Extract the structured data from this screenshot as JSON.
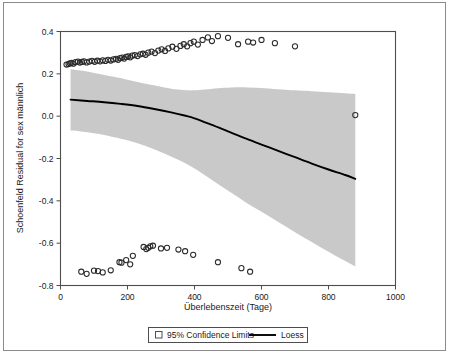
{
  "chart_data": {
    "type": "scatter",
    "title": "",
    "xlabel": "Überlebenszeit (Tage)",
    "ylabel": "Schoenfeld Residual for sex männlich",
    "xlim": [
      0,
      1000
    ],
    "ylim": [
      -0.8,
      0.4
    ],
    "xticks": [
      "0",
      "200",
      "400",
      "600",
      "800",
      "1000"
    ],
    "xtick_values": [
      0,
      200,
      400,
      600,
      800,
      1000
    ],
    "yticks": [
      "0.4",
      "0.2",
      "0.0",
      "-0.2",
      "-0.4",
      "-0.6",
      "-0.8"
    ],
    "ytick_values": [
      0.4,
      0.2,
      0.0,
      -0.2,
      -0.4,
      -0.6,
      -0.8
    ],
    "grid": false,
    "legend_position": "bottom-center",
    "legend": [
      {
        "name": "95% Confidence Limits",
        "marker": "filled-square-outline",
        "color": "#c9c9c9"
      },
      {
        "name": "Loess",
        "marker": "line",
        "color": "#000000"
      }
    ],
    "series": [
      {
        "name": "Schoenfeld residuals",
        "type": "scatter",
        "marker": "open-circle",
        "color": "#2b2b2b",
        "points": [
          [
            18,
            0.244
          ],
          [
            24,
            0.246
          ],
          [
            28,
            0.25
          ],
          [
            33,
            0.252
          ],
          [
            38,
            0.248
          ],
          [
            45,
            0.255
          ],
          [
            52,
            0.258
          ],
          [
            58,
            0.253
          ],
          [
            64,
            0.256
          ],
          [
            70,
            0.259
          ],
          [
            78,
            0.254
          ],
          [
            86,
            0.258
          ],
          [
            94,
            0.261
          ],
          [
            102,
            0.257
          ],
          [
            110,
            0.262
          ],
          [
            118,
            0.259
          ],
          [
            126,
            0.264
          ],
          [
            134,
            0.261
          ],
          [
            142,
            0.266
          ],
          [
            150,
            0.263
          ],
          [
            158,
            0.268
          ],
          [
            166,
            0.271
          ],
          [
            172,
            0.266
          ],
          [
            178,
            0.274
          ],
          [
            184,
            0.277
          ],
          [
            190,
            0.272
          ],
          [
            196,
            0.28
          ],
          [
            202,
            0.283
          ],
          [
            208,
            0.278
          ],
          [
            214,
            0.286
          ],
          [
            222,
            0.289
          ],
          [
            230,
            0.284
          ],
          [
            238,
            0.292
          ],
          [
            246,
            0.295
          ],
          [
            254,
            0.29
          ],
          [
            262,
            0.3
          ],
          [
            272,
            0.305
          ],
          [
            282,
            0.298
          ],
          [
            292,
            0.31
          ],
          [
            302,
            0.316
          ],
          [
            312,
            0.308
          ],
          [
            322,
            0.32
          ],
          [
            334,
            0.328
          ],
          [
            346,
            0.318
          ],
          [
            358,
            0.332
          ],
          [
            368,
            0.34
          ],
          [
            378,
            0.33
          ],
          [
            388,
            0.345
          ],
          [
            398,
            0.352
          ],
          [
            410,
            0.338
          ],
          [
            424,
            0.36
          ],
          [
            440,
            0.372
          ],
          [
            452,
            0.355
          ],
          [
            470,
            0.378
          ],
          [
            500,
            0.37
          ],
          [
            530,
            0.34
          ],
          [
            560,
            0.352
          ],
          [
            575,
            0.348
          ],
          [
            600,
            0.36
          ],
          [
            640,
            0.345
          ],
          [
            700,
            0.33
          ],
          [
            880,
            0.005
          ],
          [
            62,
            -0.735
          ],
          [
            78,
            -0.745
          ],
          [
            100,
            -0.73
          ],
          [
            112,
            -0.732
          ],
          [
            126,
            -0.738
          ],
          [
            150,
            -0.728
          ],
          [
            176,
            -0.69
          ],
          [
            182,
            -0.692
          ],
          [
            196,
            -0.68
          ],
          [
            208,
            -0.7
          ],
          [
            216,
            -0.66
          ],
          [
            248,
            -0.618
          ],
          [
            256,
            -0.628
          ],
          [
            262,
            -0.622
          ],
          [
            268,
            -0.615
          ],
          [
            276,
            -0.612
          ],
          [
            300,
            -0.625
          ],
          [
            318,
            -0.622
          ],
          [
            352,
            -0.63
          ],
          [
            372,
            -0.638
          ],
          [
            396,
            -0.655
          ],
          [
            470,
            -0.69
          ],
          [
            540,
            -0.718
          ],
          [
            566,
            -0.735
          ]
        ]
      },
      {
        "name": "Loess",
        "type": "line",
        "color": "#000000",
        "points": [
          [
            30,
            0.078
          ],
          [
            80,
            0.072
          ],
          [
            130,
            0.066
          ],
          [
            180,
            0.058
          ],
          [
            230,
            0.048
          ],
          [
            280,
            0.034
          ],
          [
            330,
            0.018
          ],
          [
            370,
            0.003
          ],
          [
            400,
            -0.01
          ],
          [
            450,
            -0.04
          ],
          [
            500,
            -0.072
          ],
          [
            550,
            -0.104
          ],
          [
            600,
            -0.134
          ],
          [
            650,
            -0.164
          ],
          [
            700,
            -0.194
          ],
          [
            750,
            -0.224
          ],
          [
            800,
            -0.252
          ],
          [
            850,
            -0.278
          ],
          [
            880,
            -0.296
          ]
        ]
      },
      {
        "name": "95% Confidence Limits",
        "type": "band",
        "color": "#c9c9c9",
        "upper": [
          [
            30,
            0.222
          ],
          [
            60,
            0.216
          ],
          [
            90,
            0.208
          ],
          [
            120,
            0.198
          ],
          [
            150,
            0.188
          ],
          [
            190,
            0.176
          ],
          [
            230,
            0.162
          ],
          [
            270,
            0.148
          ],
          [
            310,
            0.136
          ],
          [
            350,
            0.126
          ],
          [
            380,
            0.122
          ],
          [
            400,
            0.122
          ],
          [
            430,
            0.126
          ],
          [
            470,
            0.132
          ],
          [
            510,
            0.136
          ],
          [
            560,
            0.136
          ],
          [
            610,
            0.132
          ],
          [
            660,
            0.126
          ],
          [
            700,
            0.122
          ],
          [
            750,
            0.118
          ],
          [
            800,
            0.113
          ],
          [
            850,
            0.108
          ],
          [
            880,
            0.105
          ]
        ],
        "lower": [
          [
            30,
            -0.068
          ],
          [
            60,
            -0.072
          ],
          [
            90,
            -0.078
          ],
          [
            120,
            -0.086
          ],
          [
            150,
            -0.096
          ],
          [
            190,
            -0.11
          ],
          [
            230,
            -0.128
          ],
          [
            270,
            -0.15
          ],
          [
            310,
            -0.176
          ],
          [
            350,
            -0.205
          ],
          [
            390,
            -0.238
          ],
          [
            430,
            -0.278
          ],
          [
            470,
            -0.32
          ],
          [
            510,
            -0.362
          ],
          [
            550,
            -0.404
          ],
          [
            600,
            -0.452
          ],
          [
            650,
            -0.5
          ],
          [
            700,
            -0.548
          ],
          [
            750,
            -0.594
          ],
          [
            800,
            -0.64
          ],
          [
            850,
            -0.684
          ],
          [
            880,
            -0.71
          ]
        ]
      }
    ]
  },
  "axes": {
    "x_title": "Überlebenszeit (Tage)",
    "y_title": "Schoenfeld Residual for sex männlich"
  },
  "legend": {
    "ci_label": "95% Confidence Limits",
    "loess_label": "Loess"
  },
  "colors": {
    "band": "#c9c9c9",
    "line": "#000000",
    "marker": "#2b2b2b",
    "axis": "#4d4d4d",
    "frame": "#8b8b8b",
    "background": "#ffffff"
  }
}
